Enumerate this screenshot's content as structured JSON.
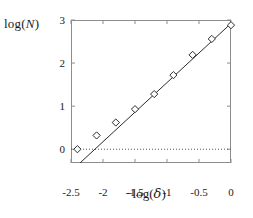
{
  "chart_data": {
    "type": "scatter",
    "title": "",
    "xlabel": "−log(δ)",
    "ylabel": "log(N)",
    "xlim": [
      -2.5,
      0.0
    ],
    "ylim": [
      -0.32,
      3.0
    ],
    "xticks": [
      -2.5,
      -2.0,
      -1.5,
      -1.0,
      -0.5,
      0.0
    ],
    "xtick_labels": [
      "-2.5",
      "-2",
      "-1.5",
      "-1",
      "-0.5",
      "0"
    ],
    "yticks": [
      0,
      1,
      2,
      3
    ],
    "ytick_labels": [
      "0",
      "1",
      "2",
      "3"
    ],
    "grid": false,
    "legend": null,
    "marker": "open-diamond",
    "series": [
      {
        "name": "box-count",
        "x": [
          -2.4,
          -2.1,
          -1.8,
          -1.5,
          -1.2,
          -0.9,
          -0.6,
          -0.3,
          0.0
        ],
        "y": [
          0.0,
          0.32,
          0.62,
          0.93,
          1.28,
          1.72,
          2.19,
          2.56,
          2.88
        ]
      }
    ],
    "fit_line": {
      "name": "linear-fit",
      "x": [
        -2.36,
        0.0
      ],
      "y": [
        -0.32,
        2.92
      ],
      "slope": 1.37,
      "intercept": 2.92
    },
    "reference_line": {
      "name": "zero-line",
      "y": 0,
      "style": "dotted"
    }
  }
}
